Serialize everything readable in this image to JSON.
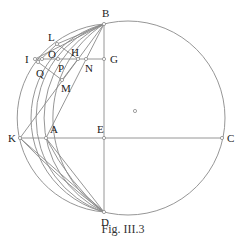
{
  "caption": "Fig. III.3",
  "labels": {
    "B": "B",
    "L": "L",
    "I": "I",
    "O": "O",
    "H": "H",
    "G": "G",
    "P": "P",
    "N": "N",
    "Q": "Q",
    "M": "M",
    "K": "K",
    "A": "A",
    "E": "E",
    "C": "C",
    "D": "D"
  },
  "colors": {
    "stroke": "#8a8a8a",
    "text": "#222222"
  }
}
